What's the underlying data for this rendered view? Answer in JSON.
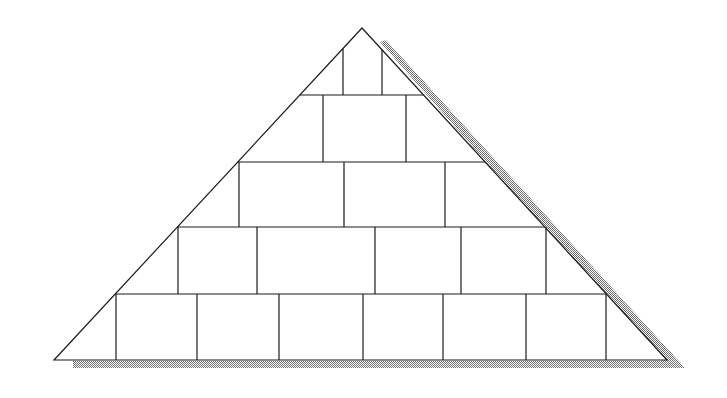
{
  "diagram": {
    "type": "pyramid-of-blocks",
    "canvas": {
      "width": 727,
      "height": 398,
      "background": "#ffffff"
    },
    "colors": {
      "stroke": "#1a1a1a",
      "fill": "#ffffff",
      "shadow": "#8a8a8a"
    },
    "triangle": {
      "apex": [
        362,
        28
      ],
      "base_left": [
        54,
        360
      ],
      "base_right": [
        667,
        360
      ]
    },
    "shadow": {
      "right_band": [
        [
          380,
          42
        ],
        [
          386,
          40
        ],
        [
          685,
          368
        ],
        [
          668,
          368
        ]
      ],
      "bottom_band": [
        [
          73,
          361
        ],
        [
          668,
          361
        ],
        [
          685,
          368
        ],
        [
          73,
          368
        ]
      ]
    },
    "row_lines_y": [
      95,
      162,
      227,
      294
    ],
    "rows": [
      {
        "row": 1,
        "y_top": 28,
        "y_bottom": 95,
        "dividers_x": [
          343,
          382
        ]
      },
      {
        "row": 2,
        "y_top": 95,
        "y_bottom": 162,
        "dividers_x": [
          323,
          406
        ]
      },
      {
        "row": 3,
        "y_top": 162,
        "y_bottom": 227,
        "dividers_x": [
          239,
          344,
          445
        ]
      },
      {
        "row": 4,
        "y_top": 227,
        "y_bottom": 294,
        "dividers_x": [
          178,
          257,
          375,
          461,
          546
        ]
      },
      {
        "row": 5,
        "y_top": 294,
        "y_bottom": 360,
        "dividers_x": [
          116,
          197,
          279,
          363,
          443,
          526,
          606
        ]
      }
    ]
  }
}
